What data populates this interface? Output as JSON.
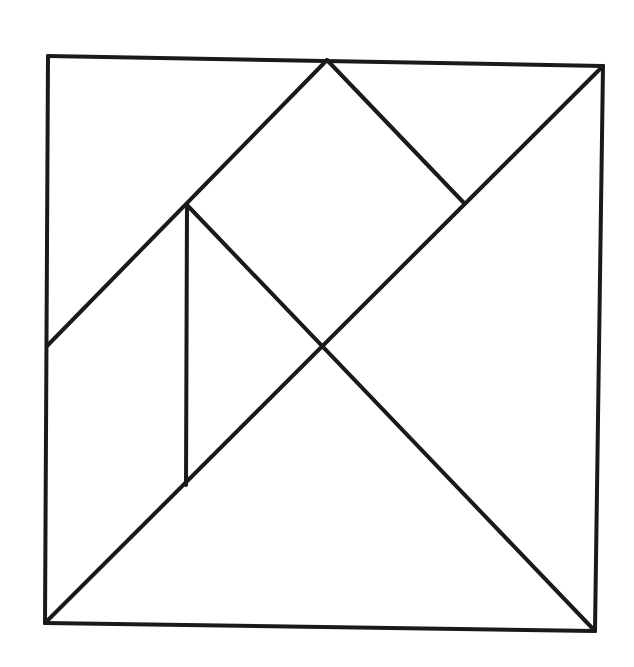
{
  "diagram": {
    "title": "Tangram square dissection",
    "stroke_color": "#1a1a1a",
    "background": "#ffffff",
    "stroke_width": 4,
    "vertices": {
      "TL": [
        48,
        56
      ],
      "TM": [
        327,
        60
      ],
      "TR": [
        603,
        66
      ],
      "LM": [
        47,
        346
      ],
      "C": [
        326,
        345
      ],
      "P": [
        187,
        205
      ],
      "Q": [
        186,
        485
      ],
      "R": [
        464,
        203
      ],
      "BL": [
        45,
        623
      ],
      "BR": [
        595,
        631
      ]
    },
    "segments": [
      {
        "name": "outer-top",
        "from": "TL",
        "to": "TR"
      },
      {
        "name": "outer-right",
        "from": "TR",
        "to": "BR"
      },
      {
        "name": "outer-bottom",
        "from": "BL",
        "to": "BR"
      },
      {
        "name": "outer-left",
        "from": "TL",
        "to": "BL"
      },
      {
        "name": "diagonal-main",
        "from": "BL",
        "to": "TR"
      },
      {
        "name": "diagonal-lm-to-tm",
        "from": "LM",
        "to": "TM"
      },
      {
        "name": "tm-to-r",
        "from": "TM",
        "to": "R"
      },
      {
        "name": "p-to-br",
        "from": "P",
        "to": "BR"
      },
      {
        "name": "p-to-q-vertical",
        "from": "P",
        "to": "Q"
      }
    ],
    "pieces": [
      {
        "name": "large-triangle-bottom",
        "shape": "triangle"
      },
      {
        "name": "large-triangle-right",
        "shape": "triangle"
      },
      {
        "name": "medium-triangle-top-left",
        "shape": "triangle"
      },
      {
        "name": "small-triangle-top-right",
        "shape": "triangle"
      },
      {
        "name": "small-triangle-center-left",
        "shape": "triangle"
      },
      {
        "name": "square-top-center",
        "shape": "square"
      },
      {
        "name": "parallelogram-left",
        "shape": "parallelogram"
      }
    ]
  }
}
